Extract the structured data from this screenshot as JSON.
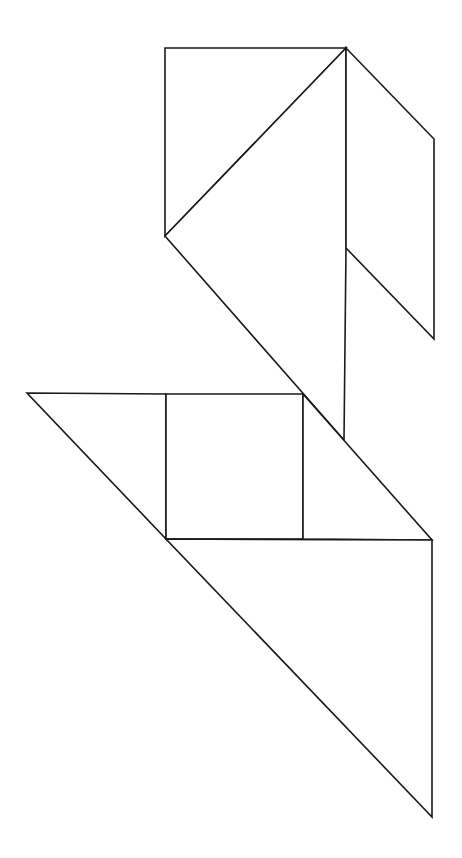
{
  "diagram": {
    "type": "tangram",
    "width": 462,
    "height": 858,
    "stroke_color": "#1a1a1a",
    "fill_color": "#ffffff",
    "pieces": [
      {
        "name": "top-left-triangle",
        "points": "165,48 346,48 165,236"
      },
      {
        "name": "middle-large-triangle",
        "points": "346,48 165,236 344,440 346,248"
      },
      {
        "name": "parallelogram-right",
        "points": "346,48 434,139 434,339 346,248"
      },
      {
        "name": "left-triangle",
        "points": "27,393 166,394 166,539"
      },
      {
        "name": "square",
        "points": "166,394 303,394 303,539 166,539"
      },
      {
        "name": "right-small-triangle",
        "points": "303,394 432,540 303,539"
      },
      {
        "name": "bottom-large-triangle",
        "points": "166,539 432,540 432,817"
      }
    ]
  }
}
